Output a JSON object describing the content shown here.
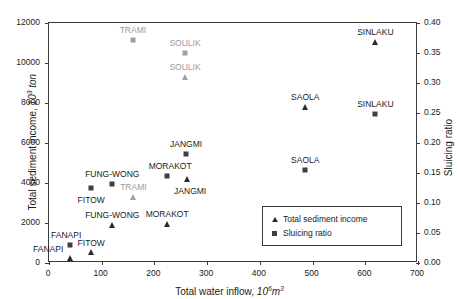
{
  "chart_data": {
    "type": "scatter",
    "title": "",
    "xlabel": "Total water inflow, 10^6 m^3",
    "ylabel": "Total sediment income, 10^3 ton",
    "y2label": "Sluicing ratio",
    "xlim": [
      0,
      700
    ],
    "ylim": [
      0,
      12000
    ],
    "y2lim": [
      0.0,
      0.4
    ],
    "grid": false,
    "legend_position": "lower-right",
    "xticks": [
      0,
      100,
      200,
      300,
      400,
      500,
      600,
      700
    ],
    "yticks": [
      0,
      2000,
      4000,
      6000,
      8000,
      10000,
      12000
    ],
    "y2ticks": [
      0.0,
      0.05,
      0.1,
      0.15,
      0.2,
      0.25,
      0.3,
      0.35,
      0.4
    ],
    "xtick_labels": [
      "0",
      "100",
      "200",
      "300",
      "400",
      "500",
      "600",
      "700"
    ],
    "ytick_labels": [
      "0",
      "2000",
      "4000",
      "6000",
      "8000",
      "10000",
      "12000"
    ],
    "y2tick_labels": [
      "0.00",
      "0.05",
      "0.10",
      "0.15",
      "0.20",
      "0.25",
      "0.30",
      "0.35",
      "0.40"
    ],
    "series": [
      {
        "name": "Total sediment income",
        "marker": "triangle",
        "axis": "left",
        "color": "#2b2b2b",
        "points": [
          {
            "label": "FANAPI",
            "x": 42,
            "y": 210,
            "label_dx": -22,
            "label_dy": -9,
            "gray": false
          },
          {
            "label": "FITOW",
            "x": 82,
            "y": 520,
            "label_dx": 0,
            "label_dy": -9,
            "gray": false
          },
          {
            "label": "FUNG-WONG",
            "x": 122,
            "y": 1840,
            "label_dx": 0,
            "label_dy": -10,
            "gray": false
          },
          {
            "label": "TRAMI",
            "x": 162,
            "y": 3250,
            "label_dx": 0,
            "label_dy": -10,
            "gray": true
          },
          {
            "label": "MORAKOT",
            "x": 226,
            "y": 1890,
            "label_dx": 0,
            "label_dy": -10,
            "gray": false
          },
          {
            "label": "JANGMI",
            "x": 264,
            "y": 4140,
            "label_dx": 3,
            "label_dy": 12,
            "gray": false
          },
          {
            "label": "SOULIK",
            "x": 260,
            "y": 9270,
            "label_dx": 0,
            "label_dy": -10,
            "gray": true
          },
          {
            "label": "SAOLA",
            "x": 488,
            "y": 7740,
            "label_dx": 0,
            "label_dy": -10,
            "gray": false
          },
          {
            "label": "SINLAKU",
            "x": 621,
            "y": 11020,
            "label_dx": 0,
            "label_dy": -10,
            "gray": false
          }
        ]
      },
      {
        "name": "Sluicing ratio",
        "marker": "square",
        "axis": "right",
        "color": "#3f3f3f",
        "points": [
          {
            "label": "FANAPI",
            "x": 42,
            "y": 0.028,
            "label_dx": -4,
            "label_dy": -10,
            "gray": false
          },
          {
            "label": "FITOW",
            "x": 82,
            "y": 0.123,
            "label_dx": 0,
            "label_dy": 12,
            "gray": false
          },
          {
            "label": "FUNG-WONG",
            "x": 122,
            "y": 0.13,
            "label_dx": 0,
            "label_dy": -10,
            "gray": false
          },
          {
            "label": "TRAMI",
            "x": 161,
            "y": 0.37,
            "label_dx": 0,
            "label_dy": -10,
            "gray": true
          },
          {
            "label": "MORAKOT",
            "x": 226,
            "y": 0.143,
            "label_dx": 3,
            "label_dy": -10,
            "gray": false
          },
          {
            "label": "JANGMI",
            "x": 262,
            "y": 0.18,
            "label_dx": 0,
            "label_dy": -10,
            "gray": false
          },
          {
            "label": "SOULIK",
            "x": 260,
            "y": 0.349,
            "label_dx": 0,
            "label_dy": -10,
            "gray": true
          },
          {
            "label": "SAOLA",
            "x": 488,
            "y": 0.153,
            "label_dx": 0,
            "label_dy": -10,
            "gray": false
          },
          {
            "label": "SINLAKU",
            "x": 621,
            "y": 0.246,
            "label_dx": 0,
            "label_dy": -10,
            "gray": false
          }
        ]
      }
    ]
  },
  "axes": {
    "x_title_main": "Total water inflow,",
    "x_title_unit_base": "10",
    "x_title_unit_exp": "6",
    "x_title_unit_tail": "m",
    "x_title_unit_tail_exp": "3",
    "y_left_title_main": "Total sediment income,",
    "y_left_unit_base": "10",
    "y_left_unit_exp": "3",
    "y_left_unit_tail": "ton",
    "y_right_title": "Sluicing ratio"
  },
  "legend": {
    "entries": [
      {
        "marker": "triangle",
        "label": "Total sediment income"
      },
      {
        "marker": "square",
        "label": "Sluicing ratio"
      }
    ]
  }
}
